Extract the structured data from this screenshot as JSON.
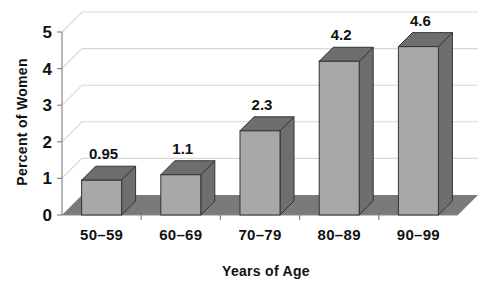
{
  "chart_data": {
    "type": "bar",
    "title": "",
    "subtitle": "",
    "categories": [
      "50–59",
      "60–69",
      "70–79",
      "80–89",
      "90–99"
    ],
    "values": [
      0.95,
      1.1,
      2.3,
      4.2,
      4.6
    ],
    "data_labels": [
      "0.95",
      "1.1",
      "2.3",
      "4.2",
      "4.6"
    ],
    "xlabel": "Years of Age",
    "ylabel": "Percent of Women",
    "ylim": [
      0,
      5
    ],
    "yticks": [
      0,
      1,
      2,
      3,
      4,
      5
    ],
    "ytick_labels": [
      "0",
      "1",
      "2",
      "3",
      "4",
      "5"
    ],
    "grid": true,
    "grid_axis": "y",
    "legend": false,
    "legend_position": "none",
    "style": "3d-bar",
    "annotations": [],
    "colors": {
      "bar_front": "#a8a8a8",
      "bar_top": "#6e6e6e",
      "bar_side": "#6e6e6e",
      "bar_outline": "#333333",
      "floor": "#7a7a7a",
      "gridline": "#d8d8d8",
      "axis": "#888888",
      "text": "#111111",
      "background": "#ffffff"
    }
  }
}
